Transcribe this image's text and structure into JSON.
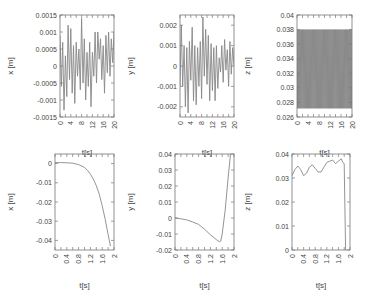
{
  "chart_data": [
    {
      "type": "line",
      "panel": "top-left",
      "xlabel": "t[s]",
      "ylabel": "x [m]",
      "xlim": [
        0,
        20
      ],
      "ylim": [
        -0.0015,
        0.0015
      ],
      "xticks": [
        "0",
        "4",
        "8",
        "12",
        "16",
        "20"
      ],
      "yticks": [
        "0.0015",
        "0.001",
        "0.0005",
        "0",
        "-0.0005",
        "-0.001",
        "-0.0015"
      ],
      "series": [
        {
          "name": "x",
          "x": [
            0,
            0.5,
            1,
            1.5,
            2,
            2.5,
            3,
            3.5,
            4,
            4.5,
            5,
            5.5,
            6,
            6.5,
            7,
            7.5,
            8,
            8.5,
            9,
            9.5,
            10,
            10.5,
            11,
            11.5,
            12,
            12.5,
            13,
            13.5,
            14,
            14.5,
            15,
            15.5,
            16,
            16.5,
            17,
            17.5,
            18,
            18.5,
            19,
            19.5,
            20
          ],
          "values": [
            0.0009,
            -0.0006,
            0.0007,
            -0.0013,
            0.0003,
            -0.0009,
            0.0012,
            -0.0004,
            0.0011,
            -0.0008,
            0.0006,
            -0.0011,
            0.0007,
            -0.0003,
            0.0005,
            -0.0007,
            0.0014,
            -0.0005,
            0.0008,
            -0.001,
            0.0004,
            -0.0006,
            0.0007,
            -0.0012,
            0.0004,
            -0.0003,
            0.001,
            -0.0005,
            0.001,
            0.0002,
            0.0008,
            -0.0004,
            0.0006,
            -0.0008,
            0.0009,
            -0.0002,
            0.001,
            -0.0003,
            0.0008,
            0.0001,
            0.001
          ]
        }
      ]
    },
    {
      "type": "line",
      "panel": "top-middle",
      "xlabel": "t[s]",
      "ylabel": "y [m]",
      "xlim": [
        0,
        20
      ],
      "ylim": [
        -0.0025,
        0.0025
      ],
      "xticks": [
        "0",
        "4",
        "8",
        "12",
        "16",
        "20"
      ],
      "yticks": [
        "0.002",
        "0.001",
        "0",
        "-0.001",
        "-0.002"
      ],
      "series": [
        {
          "name": "y",
          "x": [
            0,
            0.5,
            1,
            1.5,
            2,
            2.5,
            3,
            3.5,
            4,
            4.5,
            5,
            5.5,
            6,
            6.5,
            7,
            7.5,
            8,
            8.5,
            9,
            9.5,
            10,
            10.5,
            11,
            11.5,
            12,
            12.5,
            13,
            13.5,
            14,
            14.5,
            15,
            15.5,
            16,
            16.5,
            17,
            17.5,
            18,
            18.5,
            19,
            19.5,
            20
          ],
          "values": [
            -0.001,
            0.002,
            -0.001,
            0.001,
            -0.002,
            0.0009,
            -0.0023,
            0.0012,
            -0.0007,
            0.0019,
            -0.0017,
            0.001,
            -0.0019,
            0.0009,
            -0.001,
            0.0012,
            -0.0016,
            0.0024,
            -0.0005,
            0.0018,
            -0.0009,
            0.0015,
            -0.0017,
            0.0011,
            -0.0012,
            0.0009,
            -0.0017,
            0.001,
            -0.0011,
            0.0004,
            -0.0003,
            0.001,
            -0.0008,
            0.0013,
            -0.0002,
            0.0008,
            -0.001,
            0.0012,
            -0.0004,
            0.0009,
            0.0
          ]
        }
      ]
    },
    {
      "type": "line",
      "panel": "top-right",
      "xlabel": "t[s]",
      "ylabel": "z [m]",
      "xlim": [
        0,
        20
      ],
      "ylim": [
        0.026,
        0.04
      ],
      "xticks": [
        "0",
        "4",
        "8",
        "12",
        "16",
        "20"
      ],
      "yticks": [
        "0.04",
        "0.038",
        "0.036",
        "0.034",
        "0.032",
        "0.03",
        "0.028",
        "0.026"
      ],
      "series": [
        {
          "name": "z",
          "description": "dense high-frequency oscillation between ~0.0272 and ~0.038",
          "min": 0.0272,
          "max": 0.038,
          "cycles": 60
        }
      ]
    },
    {
      "type": "line",
      "panel": "bottom-left",
      "xlabel": "t[s]",
      "ylabel": "x [m]",
      "xlim": [
        0,
        2
      ],
      "ylim": [
        -0.045,
        0.005
      ],
      "xticks": [
        "0",
        "0.4",
        "0.8",
        "1.2",
        "1.6",
        "2"
      ],
      "yticks": [
        "0",
        "-0.01",
        "-0.02",
        "-0.03",
        "-0.04"
      ],
      "series": [
        {
          "name": "x",
          "x": [
            0,
            0.2,
            0.4,
            0.6,
            0.8,
            1.0,
            1.1,
            1.2,
            1.3,
            1.4,
            1.5,
            1.6,
            1.7,
            1.8,
            1.88
          ],
          "values": [
            0.0005,
            0.0005,
            0.0004,
            0.0002,
            -0.0005,
            -0.002,
            -0.0035,
            -0.0055,
            -0.008,
            -0.0115,
            -0.016,
            -0.022,
            -0.029,
            -0.037,
            -0.043
          ]
        }
      ]
    },
    {
      "type": "line",
      "panel": "bottom-middle",
      "xlabel": "t[s]",
      "ylabel": "y [m]",
      "xlim": [
        0,
        2
      ],
      "ylim": [
        -0.02,
        0.04
      ],
      "xticks": [
        "0",
        "0.4",
        "0.8",
        "1.2",
        "1.6",
        "2"
      ],
      "yticks": [
        "0.04",
        "0.03",
        "0.02",
        "0.01",
        "0",
        "-0.01",
        "-0.02"
      ],
      "series": [
        {
          "name": "y",
          "x": [
            0,
            0.2,
            0.4,
            0.6,
            0.8,
            1.0,
            1.2,
            1.4,
            1.5,
            1.55,
            1.6,
            1.7,
            1.8,
            1.88
          ],
          "values": [
            0.0,
            -0.0005,
            -0.0012,
            -0.0025,
            -0.004,
            -0.007,
            -0.0105,
            -0.0135,
            -0.0148,
            -0.0145,
            -0.01,
            0.005,
            0.025,
            0.04
          ]
        }
      ]
    },
    {
      "type": "line",
      "panel": "bottom-right",
      "xlabel": "t[s]",
      "ylabel": "z [m]",
      "xlim": [
        0,
        2
      ],
      "ylim": [
        0,
        0.04
      ],
      "xticks": [
        "0",
        "0.4",
        "0.8",
        "1.2",
        "1.6",
        "2"
      ],
      "yticks": [
        "0.04",
        "0.03",
        "0.02",
        "0.01",
        "0"
      ],
      "series": [
        {
          "name": "z",
          "x": [
            0,
            0.1,
            0.2,
            0.3,
            0.4,
            0.5,
            0.6,
            0.7,
            0.8,
            0.9,
            1.0,
            1.1,
            1.2,
            1.3,
            1.4,
            1.5,
            1.6,
            1.7,
            1.75,
            1.8,
            1.82,
            1.85
          ],
          "values": [
            0.031,
            0.0335,
            0.035,
            0.0335,
            0.031,
            0.032,
            0.0345,
            0.0355,
            0.034,
            0.0325,
            0.0325,
            0.0345,
            0.0365,
            0.037,
            0.0375,
            0.036,
            0.037,
            0.038,
            0.0365,
            0.036,
            0.02,
            0.0
          ]
        }
      ]
    }
  ]
}
